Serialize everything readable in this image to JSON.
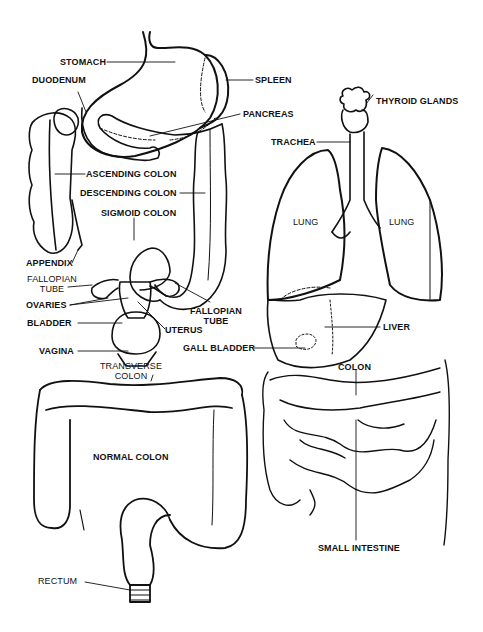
{
  "figures": {
    "digestive_reproductive": {
      "labels": {
        "stomach": "STOMACH",
        "duodenum": "DUODENUM",
        "spleen": "SPLEEN",
        "pancreas": "PANCREAS",
        "ascending_colon": "ASCENDING COLON",
        "descending_colon": "DESCENDING COLON",
        "sigmoid_colon": "SIGMOID COLON",
        "appendix": "APPENDIX",
        "fallopian_tube_left_1": "FALLOPIAN",
        "fallopian_tube_left_2": "TUBE",
        "ovaries": "OVARIES",
        "bladder": "BLADDER",
        "vagina": "VAGINA",
        "fallopian_tube_right_1": "FALLOPIAN",
        "fallopian_tube_right_2": "TUBE",
        "uterus": "UTERUS"
      }
    },
    "thoracic": {
      "labels": {
        "thyroid_glands": "THYROID GLANDS",
        "trachea": "TRACHEA",
        "lung_left": "LUNG",
        "lung_right": "LUNG",
        "liver": "LIVER",
        "gall_bladder": "GALL BLADDER",
        "colon": "COLON",
        "small_intestine": "SMALL INTESTINE"
      }
    },
    "normal_colon": {
      "labels": {
        "transverse_colon_1": "TRANSVERSE",
        "transverse_colon_2": "COLON",
        "normal_colon": "NORMAL COLON",
        "rectum": "RECTUM"
      }
    }
  }
}
